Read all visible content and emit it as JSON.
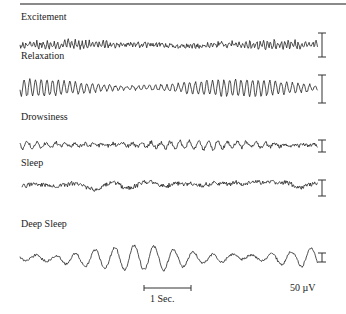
{
  "chart_data": {
    "type": "line",
    "series": [
      {
        "name": "Excitement",
        "label_y": 17,
        "baseline": 45,
        "x_start": 20,
        "x_end": 318,
        "amplitude": 3.2,
        "freq": 0.9,
        "noise": 2.2,
        "drift": 1.5,
        "seed": 3,
        "scale_bar": {
          "x": 322,
          "y1": 33,
          "y2": 57
        }
      },
      {
        "name": "Relaxation",
        "label_y": 56,
        "baseline": 88,
        "x_start": 20,
        "x_end": 318,
        "amplitude": 8.5,
        "freq": 0.55,
        "noise": 1.2,
        "drift": 0.5,
        "seed": 7,
        "scale_bar": {
          "x": 322,
          "y1": 75,
          "y2": 103
        }
      },
      {
        "name": "Drowsiness",
        "label_y": 117,
        "baseline": 145,
        "x_start": 20,
        "x_end": 318,
        "amplitude": 4.0,
        "freq": 0.33,
        "noise": 1.8,
        "drift": 1.0,
        "seed": 11,
        "scale_bar": {
          "x": 322,
          "y1": 140,
          "y2": 152
        }
      },
      {
        "name": "Sleep",
        "label_y": 163,
        "baseline": 185,
        "x_start": 22,
        "x_end": 318,
        "amplitude": 3.0,
        "freq": 0.09,
        "noise": 2.0,
        "drift": 5.0,
        "seed": 19,
        "scale_bar": {
          "x": 322,
          "y1": 180,
          "y2": 196
        }
      },
      {
        "name": "Deep Sleep",
        "label_y": 223,
        "baseline": 258,
        "x_start": 20,
        "x_end": 318,
        "amplitude": 12.0,
        "freq": 0.16,
        "noise": 1.2,
        "drift": 3.0,
        "seed": 29,
        "scale_bar": {
          "x": 322,
          "y1": 253,
          "y2": 262
        }
      }
    ],
    "time_scale": {
      "label": "1 Sec.",
      "x1": 144,
      "x2": 191,
      "y": 288
    },
    "amplitude_scale": {
      "label": "50 µV"
    },
    "xlabel": "",
    "ylabel": "",
    "legend": "none",
    "grid": false
  },
  "figure": {
    "time_bar_label": "1 Sec.",
    "amplitude_label": "50 µV"
  }
}
